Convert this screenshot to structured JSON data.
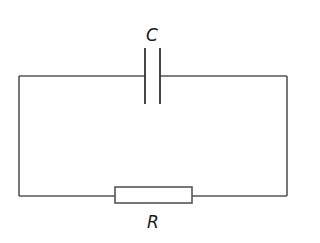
{
  "diagram": {
    "type": "circuit",
    "components": [
      {
        "id": "capacitor",
        "symbol": "capacitor",
        "label": "C",
        "position": "top"
      },
      {
        "id": "resistor",
        "symbol": "resistor",
        "label": "R",
        "position": "bottom"
      }
    ],
    "colors": {
      "wire": "#555555",
      "label": "#1a1a1a",
      "background": "#ffffff"
    }
  }
}
